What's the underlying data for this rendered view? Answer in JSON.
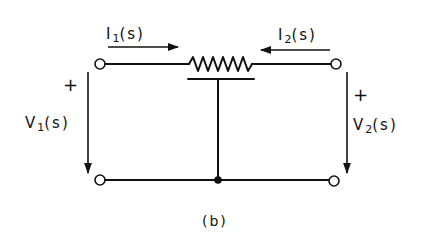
{
  "diagram": {
    "type": "two-port circuit",
    "caption": "(b)",
    "labels": {
      "i1": {
        "base": "I",
        "sub": "1",
        "rest": "(s)"
      },
      "i2": {
        "base": "I",
        "sub": "2",
        "rest": "(s)"
      },
      "v1": {
        "base": "V",
        "sub": "1",
        "rest": "(s)"
      },
      "v2": {
        "base": "V",
        "sub": "2",
        "rest": "(s)"
      },
      "v1_polarity": "+",
      "v2_polarity": "+"
    },
    "components": [
      {
        "name": "potentiometer",
        "kind": "resistor-with-wiper",
        "position": "top-center"
      },
      {
        "name": "junction",
        "kind": "node-dot",
        "position": "bottom-center"
      },
      {
        "name": "terminal-top-left",
        "kind": "open-circle"
      },
      {
        "name": "terminal-bottom-left",
        "kind": "open-circle"
      },
      {
        "name": "terminal-top-right",
        "kind": "open-circle"
      },
      {
        "name": "terminal-bottom-right",
        "kind": "open-circle"
      }
    ],
    "arrows": [
      {
        "name": "i1-arrow",
        "direction": "right"
      },
      {
        "name": "i2-arrow",
        "direction": "left"
      },
      {
        "name": "v1-arrow",
        "direction": "down"
      },
      {
        "name": "v2-arrow",
        "direction": "down"
      }
    ],
    "colors": {
      "ink": "#111111",
      "background": "#ffffff"
    }
  }
}
